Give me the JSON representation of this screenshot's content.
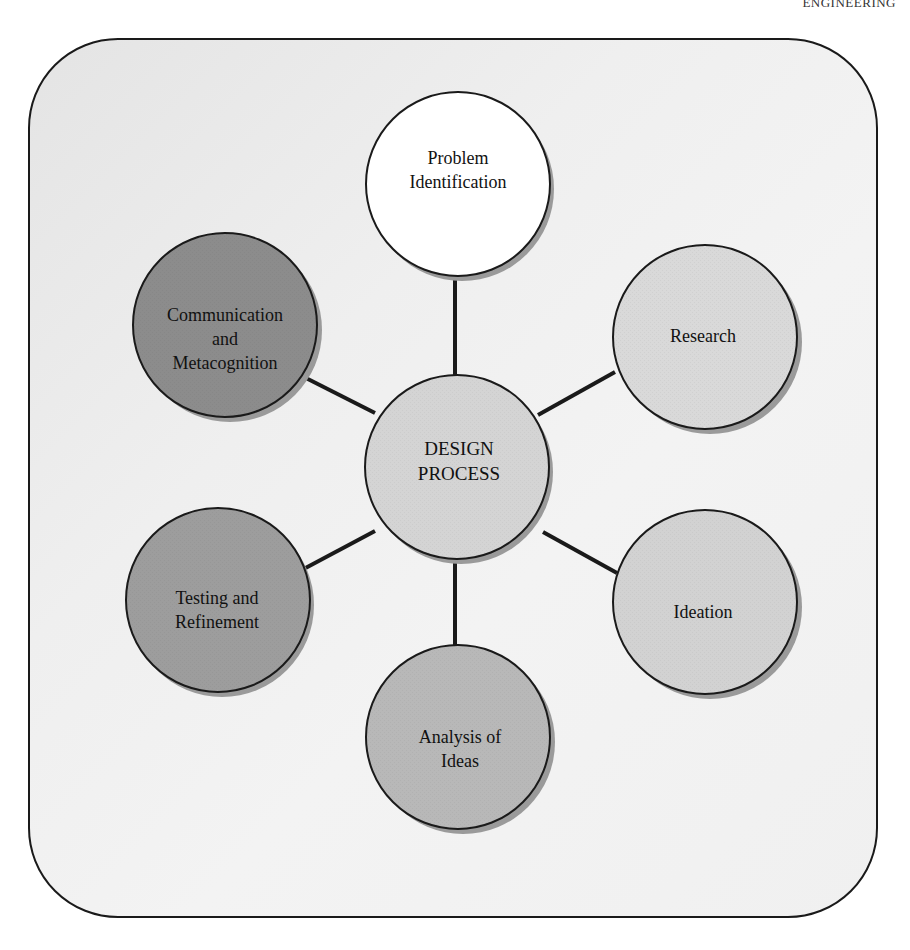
{
  "header": {
    "running_head": "ENGINEERING"
  },
  "diagram": {
    "center": {
      "label_lines": [
        "DESIGN",
        "PROCESS"
      ],
      "fill": "#d4d4d4"
    },
    "nodes": [
      {
        "id": "problem-identification",
        "label_lines": [
          "Problem",
          "Identification"
        ],
        "fill": "#ffffff",
        "position": "top"
      },
      {
        "id": "research",
        "label_lines": [
          "Research"
        ],
        "fill": "#d9d9d9",
        "position": "upper-right"
      },
      {
        "id": "ideation",
        "label_lines": [
          "Ideation"
        ],
        "fill": "#d2d2d2",
        "position": "lower-right"
      },
      {
        "id": "analysis-of-ideas",
        "label_lines": [
          "Analysis of",
          "Ideas"
        ],
        "fill": "#b8b8b8",
        "position": "bottom"
      },
      {
        "id": "testing-and-refinement",
        "label_lines": [
          "Testing and",
          "Refinement"
        ],
        "fill": "#9d9d9d",
        "position": "lower-left"
      },
      {
        "id": "communication-and-metacognition",
        "label_lines": [
          "Communication",
          "and",
          "Metacognition"
        ],
        "fill": "#8c8c8c",
        "position": "upper-left"
      }
    ],
    "connector_color": "#1a1a1a",
    "outline_color": "#1a1a1a",
    "shadow_color": "#9a9a9a"
  }
}
